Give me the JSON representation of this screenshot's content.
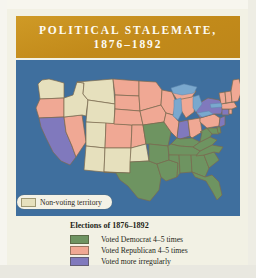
{
  "figure": {
    "title_line1": "POLITICAL STALEMATE,",
    "title_line2": "1876–1892",
    "banner_color": "#c8911f",
    "panel_color": "#f2f1e4",
    "ocean_color": "#3f6f9e"
  },
  "map": {
    "nonvoting": {
      "label": "Non-voting territory",
      "swatch_color": "#e6e0bd",
      "swatch_icon": "color-swatch-icon"
    },
    "lake_color": "#7aa8ce",
    "border_color": "#7d6a4e",
    "state_groups": [
      {
        "category": "democrat",
        "color": "#6e9461",
        "states": [
          "Texas",
          "Louisiana",
          "Arkansas",
          "Mississippi",
          "Alabama",
          "Georgia",
          "Florida",
          "South Carolina",
          "North Carolina",
          "Tennessee",
          "Kentucky",
          "Virginia",
          "West Virginia",
          "Missouri",
          "Maryland",
          "Delaware"
        ]
      },
      {
        "category": "republican",
        "color": "#f0a894",
        "states": [
          "Maine",
          "New Hampshire",
          "Vermont",
          "Massachusetts",
          "Rhode Island",
          "Connecticut",
          "Pennsylvania",
          "Ohio",
          "Michigan",
          "Illinois",
          "Iowa",
          "Wisconsin",
          "Minnesota",
          "Nebraska",
          "Kansas",
          "Colorado",
          "Oregon",
          "Nevada",
          "North Dakota",
          "South Dakota"
        ]
      },
      {
        "category": "irregular",
        "color": "#8079bd",
        "states": [
          "California",
          "New York",
          "New Jersey",
          "Indiana",
          "Connecticut"
        ]
      },
      {
        "category": "nonvoting",
        "color": "#e6e0bd",
        "states": [
          "Washington Territory",
          "Idaho Territory",
          "Montana Territory",
          "Wyoming Territory",
          "Utah Territory",
          "Arizona Territory",
          "New Mexico Territory",
          "Oklahoma Territory",
          "Indian Territory"
        ]
      }
    ]
  },
  "legend": {
    "title": "Elections of 1876–1892",
    "items": [
      {
        "label": "Voted Democrat 4–5 times",
        "color": "#6e9461",
        "swatch_icon": "color-swatch-icon"
      },
      {
        "label": "Voted Republican 4–5 times",
        "color": "#f0a894",
        "swatch_icon": "color-swatch-icon"
      },
      {
        "label": "Voted more irregularly",
        "color": "#8079bd",
        "swatch_icon": "color-swatch-icon"
      }
    ]
  }
}
